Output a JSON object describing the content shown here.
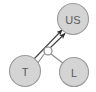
{
  "diagram": {
    "type": "causal-path-diagram",
    "width": 96,
    "height": 92,
    "background_color": "#ffffff",
    "node_fill_color": "#d4d4d4",
    "node_stroke_color": "#9a9a9a",
    "junction_fill_color": "#ffffff",
    "edge_color": "#8c8c8c",
    "arrow_color": "#2e2e2e",
    "label_color": "#5a5a5a",
    "nodes": [
      {
        "id": "us",
        "label": "US",
        "cx": 73,
        "cy": 19,
        "r": 15.5,
        "font_size": 11,
        "kind": "filled"
      },
      {
        "id": "t",
        "label": "T",
        "cx": 25,
        "cy": 71,
        "r": 15.5,
        "font_size": 11,
        "kind": "filled"
      },
      {
        "id": "l",
        "label": "L",
        "cx": 74,
        "cy": 72,
        "r": 14.5,
        "font_size": 11,
        "kind": "filled"
      },
      {
        "id": "junction",
        "label": "",
        "cx": 48,
        "cy": 51,
        "r": 4,
        "font_size": 0,
        "kind": "hollow"
      }
    ],
    "edges": [
      {
        "id": "t-to-us",
        "from": "t",
        "to": "us",
        "directed": true,
        "x1": 34,
        "y1": 59,
        "x2": 62,
        "y2": 30
      },
      {
        "id": "junction-to-us",
        "from": "junction",
        "to": "us",
        "directed": true,
        "x1": 50,
        "y1": 47,
        "x2": 65,
        "y2": 33
      },
      {
        "id": "t-to-junction",
        "from": "t",
        "to": "junction",
        "directed": false,
        "x1": 37,
        "y1": 64,
        "x2": 45,
        "y2": 53
      },
      {
        "id": "junction-to-l",
        "from": "junction",
        "to": "l",
        "directed": false,
        "x1": 51,
        "y1": 54,
        "x2": 64,
        "y2": 64
      }
    ]
  }
}
